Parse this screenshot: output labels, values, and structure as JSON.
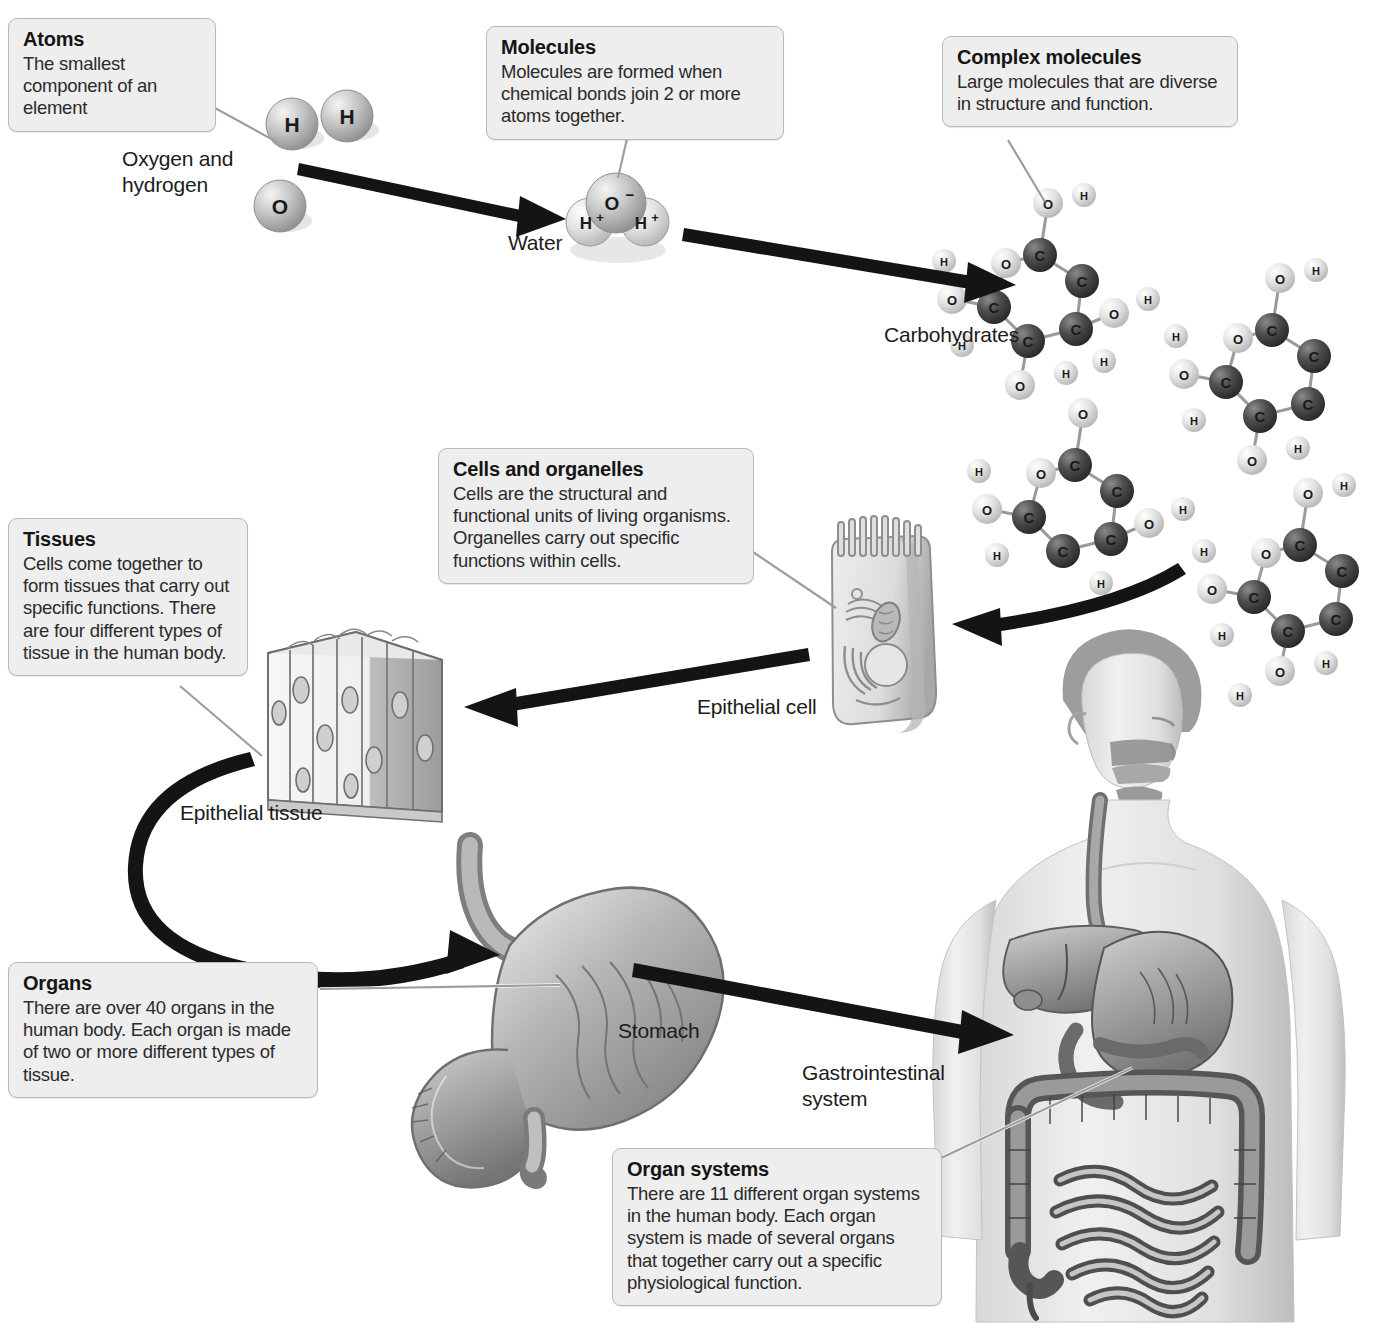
{
  "diagram": {
    "background_color": "#ffffff",
    "arrow_color": "#1a1a1a",
    "callout_fill": "#eeeeee",
    "callout_border": "#b9b9b9",
    "leader_color": "#a0a0a0"
  },
  "callouts": [
    {
      "id": "atoms",
      "title": "Atoms",
      "body": "The smallest component of an element"
    },
    {
      "id": "molecules",
      "title": "Molecules",
      "body": "Molecules are formed when chemical bonds join 2 or more atoms together."
    },
    {
      "id": "complex_molecules",
      "title": "Complex molecules",
      "body": "Large molecules that are diverse in structure and function."
    },
    {
      "id": "cells_and_organelles",
      "title": "Cells and organelles",
      "body": "Cells are the structural and functional units of living organisms. Organelles carry out specific functions within cells."
    },
    {
      "id": "tissues",
      "title": "Tissues",
      "body": "Cells come together to form tissues that carry out specific functions. There are four different types of tissue in the human body."
    },
    {
      "id": "organs",
      "title": "Organs",
      "body": "There are over 40 organs in the human body. Each organ is made of two or more different types of tissue."
    },
    {
      "id": "organ_systems",
      "title": "Organ systems",
      "body": "There are 11 different organ systems in the human body. Each organ system is made of several organs that together carry out a specific physiological function."
    }
  ],
  "labels": {
    "oxygen_and_hydrogen": "Oxygen and\nhydrogen",
    "water": "Water",
    "carbohydrates": "Carbohydrates",
    "epithelial_cell": "Epithelial cell",
    "epithelial_tissue": "Epithelial tissue",
    "stomach": "Stomach",
    "gastrointestinal_system": "Gastrointestinal\nsystem"
  },
  "atoms": {
    "hydrogen_symbol": "H",
    "oxygen_symbol": "O",
    "water_oxygen_symbol": "O",
    "water_oxygen_charge": "−",
    "water_hydrogen_symbol": "H",
    "water_hydrogen_charge": "+"
  },
  "molecule_atoms": {
    "carbon_symbol": "C",
    "oxygen_symbol": "O",
    "hydrogen_symbol": "H"
  },
  "hierarchy_steps": [
    "Atoms",
    "Molecules",
    "Complex molecules",
    "Cells and organelles",
    "Tissues",
    "Organs",
    "Organ systems"
  ]
}
